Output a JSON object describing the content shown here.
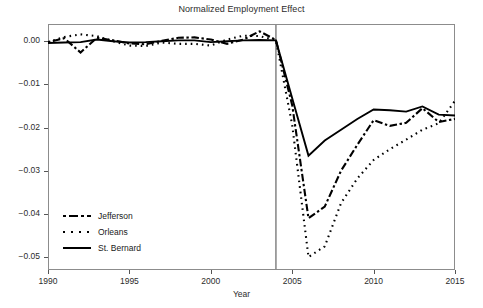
{
  "chart_data": {
    "type": "line",
    "title": "Normalized Employment Effect",
    "xlabel": "Year",
    "ylabel": "",
    "xlim": [
      1990,
      2015
    ],
    "ylim": [
      -0.053,
      0.004
    ],
    "grid": false,
    "legend_position": "lower-left-inside",
    "xticks": [
      "1990",
      "1995",
      "2000",
      "2005",
      "2010",
      "2015"
    ],
    "xtick_values": [
      1990,
      1995,
      2000,
      2005,
      2010,
      2015
    ],
    "yticks": [
      "0.00",
      "−0.01",
      "−0.02",
      "−0.03",
      "−0.04",
      "−0.05"
    ],
    "ytick_values": [
      0.0,
      -0.01,
      -0.02,
      -0.03,
      -0.04,
      -0.05
    ],
    "annotations": [
      {
        "type": "vline",
        "x": 2004,
        "color": "#8c8c8c",
        "label": ""
      }
    ],
    "x": [
      1990,
      1991,
      1992,
      1993,
      1994,
      1995,
      1996,
      1997,
      1998,
      1999,
      2000,
      2001,
      2002,
      2003,
      2004,
      2005,
      2006,
      2007,
      2008,
      2009,
      2010,
      2011,
      2012,
      2013,
      2014,
      2015
    ],
    "series": [
      {
        "name": "Jefferson",
        "style": "dashdot",
        "color": "#000000",
        "values": [
          -0.0002,
          0.0007,
          -0.0026,
          0.0008,
          0.0002,
          -0.0005,
          -0.0007,
          0.0001,
          0.0008,
          0.0009,
          0.0004,
          -0.0006,
          0.0004,
          0.0023,
          0.0003,
          -0.0148,
          -0.041,
          -0.0383,
          -0.03,
          -0.024,
          -0.0183,
          -0.0196,
          -0.0189,
          -0.0155,
          -0.0187,
          -0.018
        ]
      },
      {
        "name": "Orleans",
        "style": "dotted",
        "color": "#000000",
        "values": [
          -0.0002,
          0.001,
          0.0016,
          0.0012,
          0.0,
          -0.001,
          -0.0011,
          -0.0003,
          -0.0006,
          -0.0006,
          -0.001,
          0.0004,
          0.0013,
          0.0012,
          0.0002,
          -0.0194,
          -0.05,
          -0.0475,
          -0.0375,
          -0.0318,
          -0.0275,
          -0.025,
          -0.0228,
          -0.0205,
          -0.019,
          -0.0138
        ]
      },
      {
        "name": "St. Bernard",
        "style": "solid",
        "color": "#000000",
        "values": [
          -0.0004,
          -0.0003,
          -0.0002,
          0.0004,
          0.0,
          -0.0003,
          -0.0002,
          0.0,
          0.0002,
          0.0002,
          -0.0002,
          0.0,
          0.0002,
          0.0003,
          0.0002,
          -0.0132,
          -0.0265,
          -0.023,
          -0.0205,
          -0.018,
          -0.0158,
          -0.016,
          -0.0163,
          -0.0151,
          -0.017,
          -0.0172
        ]
      }
    ]
  },
  "legend": {
    "items": [
      {
        "label": "Jefferson",
        "style": "dashdot"
      },
      {
        "label": "Orleans",
        "style": "dotted"
      },
      {
        "label": "St. Bernard",
        "style": "solid"
      }
    ]
  }
}
